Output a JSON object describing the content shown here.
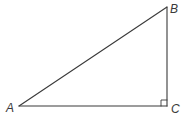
{
  "diagram": {
    "type": "right-triangle",
    "stroke_color": "#3a3a3a",
    "background": "#ffffff",
    "vertices": {
      "A": {
        "label": "A",
        "x": 19,
        "y": 106
      },
      "B": {
        "label": "B",
        "x": 167,
        "y": 7
      },
      "C": {
        "label": "C",
        "x": 167,
        "y": 106
      }
    },
    "right_angle_at": "C",
    "sides": [
      {
        "name": "AB",
        "from": "A",
        "to": "B"
      },
      {
        "name": "BC",
        "from": "B",
        "to": "C"
      },
      {
        "name": "AC",
        "from": "A",
        "to": "C"
      }
    ]
  }
}
